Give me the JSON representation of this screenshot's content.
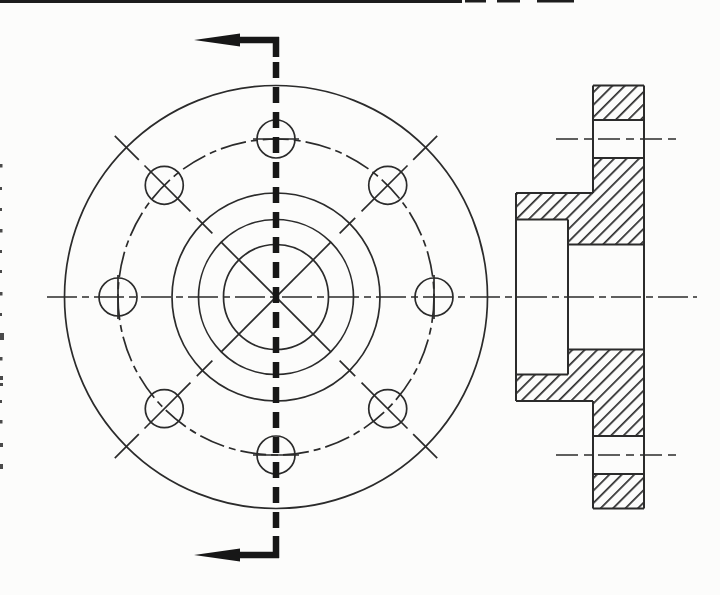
{
  "canvas": {
    "w": 720,
    "h": 595,
    "bg": "#fcfcfb"
  },
  "styles": {
    "line_color": "#2b2b2b",
    "thick_color": "#171717",
    "speck_color": "#4a4a4a",
    "edge_line_color": "#1d1d1d",
    "thin_w": 1.7,
    "outline_w": 2,
    "thick_w": 6.5,
    "centerline_dash": "30 5 7 5",
    "bolt_dash": "26 5 7 5",
    "cut_dash": "16 9",
    "holecl_dash": "22 6 8 6",
    "hatch": {
      "spacing": 8.8,
      "line_w": 1.7,
      "angle": 45
    }
  },
  "axis": {
    "name": "main-center-axis",
    "y": 297,
    "x1": 47,
    "x2": 697
  },
  "front_view": {
    "name": "front-view",
    "cx": 276,
    "cy": 297,
    "circles": [
      {
        "name": "outer-flange-circle",
        "r": 211.5,
        "dash": "solid"
      },
      {
        "name": "bolt-circle",
        "r": 158,
        "dash": "dashdot"
      },
      {
        "name": "hub-circle",
        "r": 104,
        "dash": "solid"
      },
      {
        "name": "counterbore-circle",
        "r": 77.5,
        "dash": "solid"
      },
      {
        "name": "bore-circle",
        "r": 52.5,
        "dash": "solid"
      }
    ],
    "cross": {
      "name": "bore-diagonal-cross",
      "r": 77.5,
      "angles": [
        45,
        135
      ]
    },
    "holes": {
      "name": "bolt-hole",
      "count": 8,
      "r": 19,
      "ring_r": 158,
      "start_angle": 0,
      "step": 45
    },
    "axis_hole_marks": [
      {
        "name": "top-hole-centermark",
        "x1": 253,
        "y1": 139,
        "x2": 299,
        "y2": 139
      },
      {
        "name": "bottom-hole-centermark",
        "x1": 253,
        "y1": 455,
        "x2": 299,
        "y2": 455
      },
      {
        "name": "left-hole-centermark",
        "x1": 118,
        "y1": 275,
        "x2": 118,
        "y2": 319
      },
      {
        "name": "right-hole-centermark",
        "x1": 434,
        "y1": 275,
        "x2": 434,
        "y2": 319
      }
    ],
    "diag_angles": [
      45,
      135,
      225,
      315
    ],
    "diag_mark_radii": [
      [
        90,
        112
      ],
      [
        121,
        186
      ],
      [
        194,
        228
      ]
    ]
  },
  "cutting_plane": {
    "name": "cutting-plane",
    "x": 276,
    "dash_y1": 62,
    "dash_y2": 530,
    "top": {
      "bend_h": [
        240,
        40,
        279,
        40
      ],
      "bend_v": [
        276,
        37,
        276,
        57
      ],
      "arrow": [
        [
          194,
          40
        ],
        [
          240,
          33.5
        ],
        [
          240,
          46.5
        ]
      ]
    },
    "bottom": {
      "bend_h": [
        240,
        555,
        279,
        555
      ],
      "bend_v": [
        276,
        536,
        276,
        558
      ],
      "arrow": [
        [
          194,
          555
        ],
        [
          240,
          548.5
        ],
        [
          240,
          561.5
        ]
      ]
    }
  },
  "section_view": {
    "name": "section-view",
    "hatch_polygons": [
      {
        "name": "section-flange-rim-upper",
        "pts": [
          [
            593,
            85.5
          ],
          [
            644,
            85.5
          ],
          [
            644,
            120
          ],
          [
            593,
            120
          ]
        ]
      },
      {
        "name": "section-flange-hub-upper",
        "pts": [
          [
            593,
            158
          ],
          [
            644,
            158
          ],
          [
            644,
            244.5
          ],
          [
            568,
            244.5
          ],
          [
            568,
            219.5
          ],
          [
            516,
            219.5
          ],
          [
            516,
            193
          ],
          [
            593,
            193
          ]
        ]
      },
      {
        "name": "section-flange-hub-lower",
        "pts": [
          [
            568,
            349.5
          ],
          [
            644,
            349.5
          ],
          [
            644,
            436
          ],
          [
            593,
            436
          ],
          [
            593,
            401
          ],
          [
            516,
            401
          ],
          [
            516,
            374.5
          ],
          [
            568,
            374.5
          ]
        ]
      },
      {
        "name": "section-flange-rim-lower",
        "pts": [
          [
            593,
            474
          ],
          [
            644,
            474
          ],
          [
            644,
            508.5
          ],
          [
            593,
            508.5
          ]
        ]
      }
    ],
    "outline": [
      [
        593,
        85.5,
        644,
        85.5
      ],
      [
        593,
        508.5,
        644,
        508.5
      ],
      [
        593,
        85.5,
        593,
        193
      ],
      [
        593,
        401,
        593,
        508.5
      ],
      [
        644,
        85.5,
        644,
        508.5
      ],
      [
        516,
        193,
        516,
        401
      ],
      [
        568,
        219.5,
        568,
        374.5
      ],
      [
        516,
        193,
        593,
        193
      ],
      [
        516,
        401,
        593,
        401
      ],
      [
        516,
        219.5,
        568,
        219.5
      ],
      [
        516,
        374.5,
        568,
        374.5
      ],
      [
        568,
        244.5,
        644,
        244.5
      ],
      [
        568,
        349.5,
        644,
        349.5
      ],
      [
        593,
        120,
        644,
        120
      ],
      [
        593,
        158,
        644,
        158
      ],
      [
        593,
        436,
        644,
        436
      ],
      [
        593,
        474,
        644,
        474
      ]
    ],
    "hole_centerlines": [
      [
        556,
        139,
        676,
        139
      ],
      [
        556,
        455,
        676,
        455
      ]
    ]
  },
  "artifacts": {
    "top_border": [
      [
        0,
        0,
        462,
        3
      ],
      [
        465,
        0,
        21,
        2.5
      ],
      [
        497,
        0,
        23,
        2.5
      ],
      [
        537,
        0,
        37,
        2.5
      ]
    ],
    "left_specks": [
      [
        0,
        164,
        2.5,
        3.5
      ],
      [
        0,
        187,
        2,
        3
      ],
      [
        0,
        208,
        2,
        3
      ],
      [
        0,
        229,
        2.5,
        3.5
      ],
      [
        0,
        250,
        2,
        3
      ],
      [
        0,
        270,
        2,
        3
      ],
      [
        0,
        292,
        2.5,
        3.5
      ],
      [
        0,
        313,
        2,
        3
      ],
      [
        0,
        333,
        4,
        7
      ],
      [
        0,
        357,
        2.5,
        3.5
      ],
      [
        0,
        376,
        3,
        4
      ],
      [
        0,
        383,
        3,
        3
      ],
      [
        0,
        400,
        2,
        3
      ],
      [
        0,
        420,
        2.5,
        3.5
      ],
      [
        0,
        443,
        3,
        4
      ],
      [
        0,
        464,
        3,
        5
      ]
    ]
  }
}
